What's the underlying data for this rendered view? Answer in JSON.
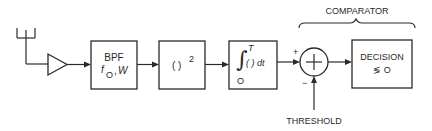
{
  "diagram": {
    "blocks": {
      "antenna": {
        "icon": "antenna-icon"
      },
      "amplifier": {
        "icon": "amplifier-triangle-icon"
      },
      "bpf": {
        "line1": "BPF",
        "param_f": "f",
        "param_f_sub": "O",
        "param_sep": ",",
        "param_w": "W"
      },
      "squarer": {
        "label": "( )",
        "superscript": "2"
      },
      "integrator": {
        "integral": "∫",
        "upper": "T",
        "lower": "O",
        "body": "( ) dt"
      },
      "summer": {
        "symbol": "+",
        "input_plus": "+",
        "input_minus": "−"
      },
      "decision": {
        "line1": "DECISION",
        "line2": "≶ O"
      }
    },
    "labels": {
      "comparator": "COMPARATOR",
      "threshold": "THRESHOLD"
    },
    "colors": {
      "stroke": "#2a2a2a",
      "background": "#ffffff"
    }
  }
}
